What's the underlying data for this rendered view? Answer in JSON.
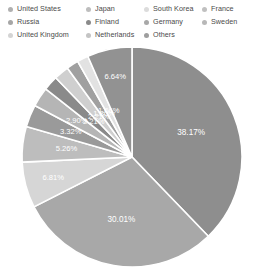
{
  "chart_data": {
    "type": "pie",
    "title": "",
    "subtitle": "",
    "xlabel": "",
    "ylabel": "",
    "legend_position": "top",
    "grid": false,
    "value_unit": "%",
    "categories": [
      "United States",
      "Russia",
      "United Kingdom",
      "Japan",
      "Finland",
      "Netherlands",
      "South Korea",
      "Germany",
      "Others",
      "France",
      "Sweden"
    ],
    "values": [
      38.17,
      30.01,
      6.81,
      5.26,
      3.32,
      2.9,
      2.21,
      2.21,
      1.8,
      1.66,
      6.64
    ],
    "slices": [
      {
        "label": "United States",
        "value": 38.17,
        "display": "38.17%",
        "color": "#8e8e8e"
      },
      {
        "label": "Russia",
        "value": 30.01,
        "display": "30.01%",
        "color": "#a8a8a8"
      },
      {
        "label": "United Kingdom",
        "value": 6.81,
        "display": "6.81%",
        "color": "#d6d6d6"
      },
      {
        "label": "Japan",
        "value": 5.26,
        "display": "5.26%",
        "color": "#bdbdbd"
      },
      {
        "label": "Finland",
        "value": 3.32,
        "display": "3.32%",
        "color": "#9a9a9a"
      },
      {
        "label": "Netherlands",
        "value": 2.9,
        "display": "2.90%",
        "color": "#b5b5b5"
      },
      {
        "label": "South Korea",
        "value": 2.21,
        "display": "2.21%",
        "color": "#8a8a8a"
      },
      {
        "label": "Germany",
        "value": 2.21,
        "display": "2.21%",
        "color": "#cfcfcf"
      },
      {
        "label": "Others",
        "value": 1.8,
        "display": "1.80%",
        "color": "#a0a0a0"
      },
      {
        "label": "France",
        "value": 1.66,
        "display": "1.66%",
        "color": "#e2e2e2"
      },
      {
        "label": "Sweden",
        "value": 6.64,
        "display": "6.64%",
        "color": "#929292"
      }
    ]
  },
  "legend": {
    "columns": [
      [
        {
          "label": "United States",
          "marker_color": "#b0b0b0",
          "marker_name": "legend-marker-united-states"
        },
        {
          "label": "Russia",
          "marker_color": "#a6a6a6",
          "marker_name": "legend-marker-russia"
        },
        {
          "label": "United Kingdom",
          "marker_color": "#d4d4d4",
          "marker_name": "legend-marker-united-kingdom"
        }
      ],
      [
        {
          "label": "Japan",
          "marker_color": "#bdbdbd",
          "marker_name": "legend-marker-japan"
        },
        {
          "label": "Finland",
          "marker_color": "#8a8a8a",
          "marker_name": "legend-marker-finland"
        },
        {
          "label": "Netherlands",
          "marker_color": "#c4c4c4",
          "marker_name": "legend-marker-netherlands"
        }
      ],
      [
        {
          "label": "South Korea",
          "marker_color": "#dcdcdc",
          "marker_name": "legend-marker-south-korea"
        },
        {
          "label": "Germany",
          "marker_color": "#a8a8a8",
          "marker_name": "legend-marker-germany"
        },
        {
          "label": "Others",
          "marker_color": "#9e9e9e",
          "marker_name": "legend-marker-others"
        }
      ],
      [
        {
          "label": "France",
          "marker_color": "#c0c0c0",
          "marker_name": "legend-marker-france"
        },
        {
          "label": "Sweden",
          "marker_color": "#b8b8b8",
          "marker_name": "legend-marker-sweden"
        }
      ]
    ]
  },
  "colors": {
    "background": "#ffffff",
    "legend_text": "#4a4a4a",
    "slice_label_text": "#ffffff",
    "slice_separator": "#ffffff"
  }
}
